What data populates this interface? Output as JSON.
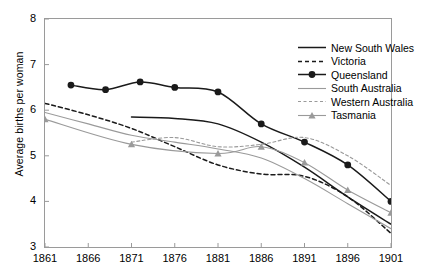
{
  "axes": {
    "ylabel": "Average births per woman",
    "yticks": [
      "8",
      "7",
      "6",
      "5",
      "4",
      "3"
    ],
    "xticks": [
      "1861",
      "1866",
      "1871",
      "1876",
      "1881",
      "1886",
      "1891",
      "1896",
      "1901"
    ]
  },
  "legend": {
    "items": [
      {
        "label": "New South Wales",
        "key": "solid-black-line",
        "color": "#1a1a1a",
        "dash": "none",
        "marker": "none"
      },
      {
        "label": "Victoria",
        "key": "dashed-black-line",
        "color": "#1a1a1a",
        "dash": "4,3",
        "marker": "none"
      },
      {
        "label": "Queensland",
        "key": "solid-black-line-circle",
        "color": "#1a1a1a",
        "dash": "none",
        "marker": "circle"
      },
      {
        "label": "South Australia",
        "key": "solid-gray-line",
        "color": "#9a9a9a",
        "dash": "none",
        "marker": "none"
      },
      {
        "label": "Western Australia",
        "key": "dashed-gray-line",
        "color": "#9a9a9a",
        "dash": "3,2.5",
        "marker": "none"
      },
      {
        "label": "Tasmania",
        "key": "solid-gray-line-triangle",
        "color": "#9a9a9a",
        "dash": "none",
        "marker": "triangle"
      }
    ]
  },
  "chart_data": {
    "type": "line",
    "title": "",
    "xlabel": "",
    "ylabel": "Average births per woman",
    "xlim": [
      1861,
      1901
    ],
    "ylim": [
      3,
      8
    ],
    "grid": false,
    "legend_position": "top-right-inside",
    "x": [
      1861,
      1866,
      1871,
      1876,
      1881,
      1886,
      1891,
      1896,
      1901
    ],
    "series": [
      {
        "name": "New South Wales",
        "color": "#1a1a1a",
        "style": "solid",
        "marker": "none",
        "x": [
          1871,
          1876,
          1881,
          1886,
          1891,
          1896,
          1901
        ],
        "values": [
          5.85,
          5.82,
          5.7,
          5.3,
          4.75,
          4.1,
          3.5
        ]
      },
      {
        "name": "Victoria",
        "color": "#1a1a1a",
        "style": "dashed",
        "marker": "none",
        "x": [
          1861,
          1866,
          1871,
          1876,
          1881,
          1886,
          1891,
          1896,
          1901
        ],
        "values": [
          6.15,
          5.9,
          5.6,
          5.2,
          4.8,
          4.6,
          4.55,
          4.1,
          3.3
        ]
      },
      {
        "name": "Queensland",
        "color": "#1a1a1a",
        "style": "solid",
        "marker": "circle",
        "x": [
          1864,
          1868,
          1872,
          1876,
          1881,
          1886,
          1891,
          1896,
          1901
        ],
        "values": [
          6.55,
          6.45,
          6.62,
          6.5,
          6.4,
          5.7,
          5.3,
          4.8,
          4.0
        ]
      },
      {
        "name": "South Australia",
        "color": "#9a9a9a",
        "style": "solid",
        "marker": "none",
        "x": [
          1861,
          1866,
          1871,
          1876,
          1881,
          1886,
          1891,
          1896,
          1901
        ],
        "values": [
          5.95,
          5.7,
          5.45,
          5.3,
          5.15,
          4.95,
          4.5,
          3.95,
          3.4
        ]
      },
      {
        "name": "Western Australia",
        "color": "#9a9a9a",
        "style": "dashed",
        "marker": "none",
        "x": [
          1871,
          1876,
          1881,
          1886,
          1891,
          1896,
          1901
        ],
        "values": [
          5.3,
          5.4,
          5.2,
          5.25,
          5.4,
          5.0,
          4.35
        ]
      },
      {
        "name": "Tasmania",
        "color": "#9a9a9a",
        "style": "solid",
        "marker": "triangle",
        "x": [
          1861,
          1871,
          1881,
          1886,
          1891,
          1896,
          1901
        ],
        "values": [
          5.8,
          5.25,
          5.05,
          5.2,
          4.85,
          4.25,
          3.75
        ]
      }
    ]
  }
}
